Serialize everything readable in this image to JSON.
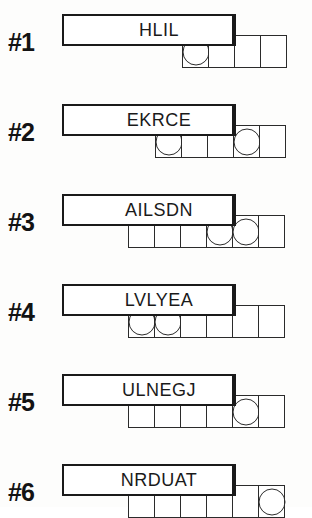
{
  "puzzle": {
    "kind": "scrambled-word-puzzle",
    "ink_color": "#1a1a1a",
    "paper_color": "#ffffff",
    "rows": [
      {
        "number_label": "#1",
        "scrambled_word": "HLIL",
        "answer_cell_count": 4,
        "circled_positions": [
          1
        ],
        "top": 14,
        "strip_left": 182,
        "strip_top": 35
      },
      {
        "number_label": "#2",
        "scrambled_word": "EKRCE",
        "answer_cell_count": 5,
        "circled_positions": [
          1,
          4
        ],
        "top": 104,
        "strip_left": 155,
        "strip_top": 125
      },
      {
        "number_label": "#3",
        "scrambled_word": "AILSDN",
        "answer_cell_count": 6,
        "circled_positions": [
          4,
          5
        ],
        "top": 194,
        "strip_left": 128,
        "strip_top": 215
      },
      {
        "number_label": "#4",
        "scrambled_word": "LVLYEA",
        "answer_cell_count": 6,
        "circled_positions": [
          1,
          2
        ],
        "top": 284,
        "strip_left": 128,
        "strip_top": 305
      },
      {
        "number_label": "#5",
        "scrambled_word": "ULNEGJ",
        "answer_cell_count": 6,
        "circled_positions": [
          5
        ],
        "top": 374,
        "strip_left": 128,
        "strip_top": 395
      },
      {
        "number_label": "#6",
        "scrambled_word": "NRDUAT",
        "answer_cell_count": 6,
        "circled_positions": [
          6
        ],
        "top": 464,
        "strip_left": 128,
        "strip_top": 485
      }
    ]
  }
}
